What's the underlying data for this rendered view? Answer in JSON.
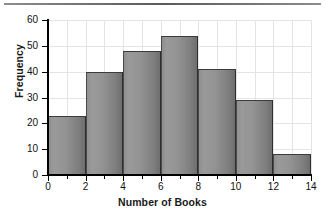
{
  "chart_data": {
    "type": "bar",
    "title": "",
    "subtitle": "",
    "xlabel": "Number of Books",
    "ylabel": "Frequency",
    "categories": [
      "0-2",
      "2-4",
      "4-6",
      "6-8",
      "8-10",
      "10-12",
      "12-14"
    ],
    "bin_edges": [
      0,
      2,
      4,
      6,
      8,
      10,
      12,
      14
    ],
    "values": [
      23,
      40,
      48,
      54,
      41,
      29,
      8
    ],
    "xlim": [
      0,
      14
    ],
    "ylim": [
      0,
      60
    ],
    "x_ticks": [
      0,
      2,
      4,
      6,
      8,
      10,
      12,
      14
    ],
    "x_tick_labels": [
      "0",
      "2",
      "4",
      "6",
      "8",
      "10",
      "12",
      "14"
    ],
    "x_minor_ticks": [
      1,
      3,
      5,
      7,
      9,
      11,
      13
    ],
    "y_ticks": [
      0,
      10,
      20,
      30,
      40,
      50,
      60
    ],
    "y_tick_labels": [
      "0",
      "10",
      "20",
      "30",
      "40",
      "50",
      "60"
    ],
    "grid": true,
    "grid_color": "#e4e4e4",
    "legend": null,
    "bar_color": "#8f8f8f",
    "bar_edge_color": "#3b3b3b",
    "axis_color": "#000000"
  },
  "figure": {
    "has_top_rule": true,
    "background": "#ffffff"
  }
}
